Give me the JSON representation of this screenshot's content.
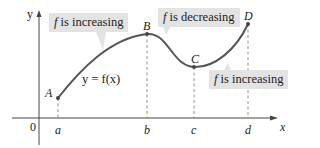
{
  "diagram": {
    "axes": {
      "x_label": "x",
      "y_label": "y",
      "origin_label": "0"
    },
    "ticks": [
      {
        "label": "a",
        "x": 58
      },
      {
        "label": "b",
        "x": 147
      },
      {
        "label": "c",
        "x": 194
      },
      {
        "label": "d",
        "x": 248
      }
    ],
    "points": [
      {
        "label": "A",
        "x": 58,
        "y": 98
      },
      {
        "label": "B",
        "x": 147,
        "y": 34
      },
      {
        "label": "C",
        "x": 194,
        "y": 67
      },
      {
        "label": "D",
        "x": 248,
        "y": 24
      }
    ],
    "curve_label": "y = f(x)",
    "callouts": [
      {
        "f": "f",
        "text": " is increasing"
      },
      {
        "f": "f",
        "text": " is decreasing"
      },
      {
        "f": "f",
        "text": " is increasing"
      }
    ],
    "colors": {
      "curve": "#555555",
      "callout_bg": "#e3e3e3",
      "axis": "#444444",
      "point": "#444444"
    }
  }
}
